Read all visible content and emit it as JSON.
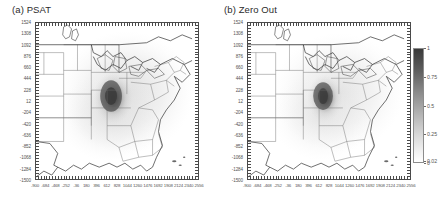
{
  "figure": {
    "background_color": "#ffffff",
    "frame_color": "#4a4a4a"
  },
  "panels": [
    {
      "id": "psat",
      "title": "(a) PSAT"
    },
    {
      "id": "zero-out",
      "title": "(b) Zero Out"
    }
  ],
  "colorbar": {
    "orientation": "vertical",
    "ticks": [
      "1",
      "0.75",
      "0.5",
      "0.25",
      "0.02",
      "0"
    ],
    "tick_values": [
      1,
      0.75,
      0.5,
      0.25,
      0.02,
      0
    ],
    "low_color": "#ffffff",
    "high_color": "#3a3a3a"
  },
  "chart_data": {
    "type": "heatmap",
    "title": "",
    "subtitle": "",
    "xlabel": "",
    "ylabel": "",
    "grid": false,
    "legend_position": "right",
    "projection_note": "Lambert-type grid over eastern United States with state boundaries and coastlines",
    "xlim": [
      -900,
      2556
    ],
    "ylim": [
      -1500,
      1524
    ],
    "xticks": [
      -900,
      -684,
      -468,
      -252,
      -36,
      180,
      396,
      612,
      828,
      1044,
      1260,
      1476,
      1692,
      1908,
      2124,
      2340,
      2556
    ],
    "xticklabels": [
      "-900",
      "-684",
      "-468",
      "-252",
      "-36",
      "180",
      "396",
      "612",
      "828",
      "1044",
      "1260",
      "1476",
      "1692",
      "1908",
      "2124",
      "2340",
      "2556"
    ],
    "yticks": [
      1524,
      1308,
      1092,
      876,
      660,
      444,
      228,
      12,
      -204,
      -420,
      -636,
      -852,
      -1068,
      -1284,
      -1500
    ],
    "yticklabels": [
      "1524",
      "1308",
      "1092",
      "876",
      "660",
      "444",
      "228",
      "12",
      "-204",
      "-420",
      "-636",
      "-852",
      "-1068",
      "-1284",
      "-1500"
    ],
    "colorbar_ticks": [
      0,
      0.02,
      0.25,
      0.5,
      0.75,
      1
    ],
    "colormap": "grayscale",
    "vmin": 0,
    "vmax": 1,
    "panels": [
      {
        "name": "(a) PSAT",
        "peak_value": 1.0,
        "peak_location_xy": [
          880,
          120
        ],
        "description": "Compact dark plume maximum over the lower Great Lakes / Ohio Valley with a broad light halo spreading across the eastern United States"
      },
      {
        "name": "(b) Zero Out",
        "peak_value": 1.0,
        "peak_location_xy": [
          880,
          120
        ],
        "description": "Similar plume maximum in the same location, slightly more compact, with comparable light halo coverage"
      }
    ]
  }
}
